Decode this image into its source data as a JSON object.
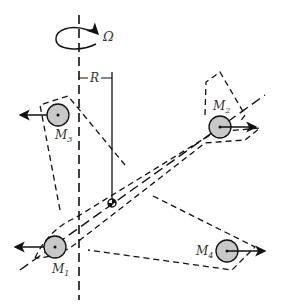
{
  "diagram": {
    "rotation_symbol": "Ω",
    "radius_label": "R",
    "masses": [
      {
        "label": "M",
        "sub": "1",
        "x": 55,
        "y": 247,
        "arrow": "left"
      },
      {
        "label": "M",
        "sub": "2",
        "x": 220,
        "y": 127,
        "arrow": "right"
      },
      {
        "label": "M",
        "sub": "3",
        "x": 58,
        "y": 115,
        "arrow": "left"
      },
      {
        "label": "M",
        "sub": "4",
        "x": 227,
        "y": 251,
        "arrow": "right"
      }
    ],
    "colors": {
      "line": "#111111",
      "mass_fill": "#c8c8c8"
    }
  }
}
